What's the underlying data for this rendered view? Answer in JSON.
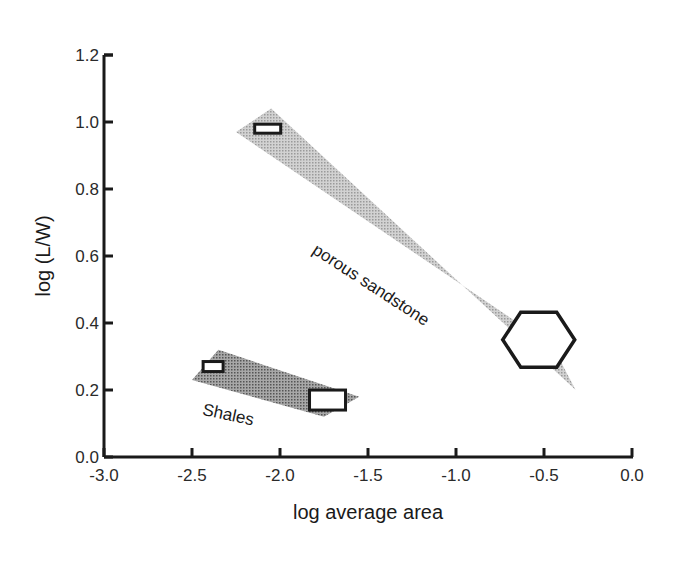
{
  "chart_data": {
    "type": "scatter",
    "title": "",
    "xlabel": "log average area",
    "ylabel": "log (L/W)",
    "xlim": [
      -3.0,
      0.0
    ],
    "ylim": [
      0.0,
      1.2
    ],
    "x_ticks": [
      "-3.0",
      "-2.5",
      "-2.0",
      "-1.5",
      "-1.0",
      "-0.5",
      "0.0"
    ],
    "y_ticks": [
      "0.0",
      "0.2",
      "0.4",
      "0.6",
      "0.8",
      "1.0",
      "1.2"
    ],
    "grid": false,
    "legend": null,
    "regions": [
      {
        "name": "porous sandstone",
        "fill": "#b8b8b8",
        "polygon": [
          [
            -2.25,
            0.97
          ],
          [
            -2.05,
            1.04
          ],
          [
            -0.32,
            0.2
          ],
          [
            -0.45,
            0.33
          ]
        ]
      },
      {
        "name": "Shales",
        "fill": "#8c8c8c",
        "polygon": [
          [
            -2.5,
            0.23
          ],
          [
            -2.35,
            0.32
          ],
          [
            -1.55,
            0.18
          ],
          [
            -1.75,
            0.12
          ]
        ]
      }
    ],
    "series": [
      {
        "name": "porous sandstone",
        "marker": "rectangle",
        "points": [
          [
            -2.07,
            0.98
          ]
        ]
      },
      {
        "name": "porous sandstone",
        "marker": "hexagon",
        "points": [
          [
            -0.53,
            0.35
          ]
        ]
      },
      {
        "name": "Shales",
        "marker": "rectangle",
        "points": [
          [
            -2.38,
            0.27
          ],
          [
            -1.73,
            0.17
          ]
        ]
      }
    ],
    "annotations": [
      {
        "text": "porous sandstone",
        "x": -1.5,
        "y": 0.5,
        "rotation": 33
      },
      {
        "text": "Shales",
        "x": -2.3,
        "y": 0.11,
        "rotation": 12
      }
    ]
  }
}
